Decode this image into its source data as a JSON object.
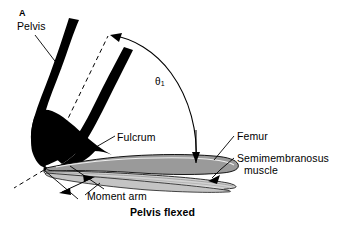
{
  "figure": {
    "panel_letter": "A",
    "caption": "Pelvis flexed",
    "background_color": "#ffffff",
    "ink_color": "#000000",
    "femur_fill_color": "#9a9a9a",
    "muscle_fill_color": "#d8d8d8"
  },
  "labels": {
    "pelvis": "Pelvis",
    "theta_symbol": "θ",
    "theta_subscript": "1",
    "fulcrum": "Fulcrum",
    "femur": "Femur",
    "semimembranosus_line1": "Semimembranosus",
    "semimembranosus_line2": "muscle",
    "moment_arm": "Moment arm"
  },
  "graphics": {
    "pelvis_bone_name": "pelvis-bone-shape",
    "femur_bone_name": "femur-bone-shape",
    "reference_axis_name": "dashed-reference-axis",
    "angle_arc_name": "angle-arc-arrow",
    "moment_arm_name": "moment-arm-dimension",
    "fulcrum_point_name": "fulcrum-point"
  }
}
